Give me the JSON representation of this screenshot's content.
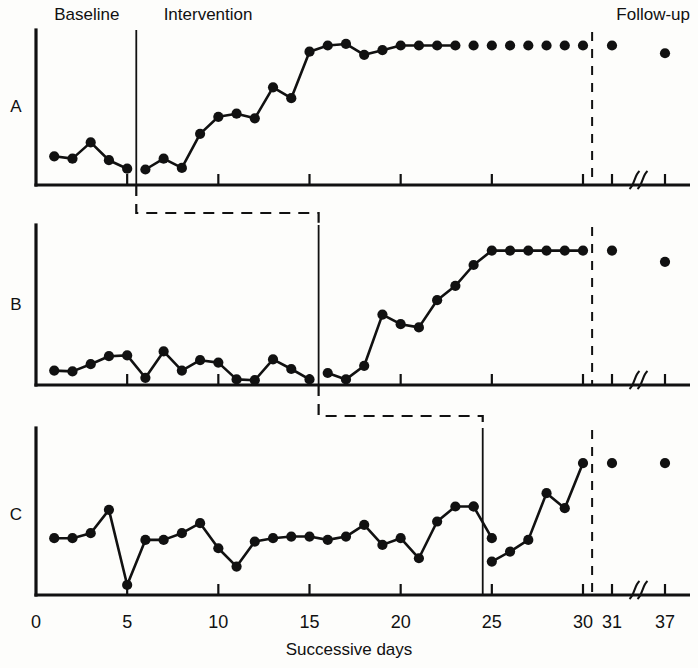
{
  "figure": {
    "background": "#fdfdfb",
    "ink": "#111111",
    "xlabel": "Successive days",
    "phase_labels": {
      "baseline": "Baseline",
      "intervention": "Intervention",
      "followup": "Follow-up"
    },
    "panel_labels": {
      "a": "A",
      "b": "B",
      "c": "C"
    },
    "axis_break_symbol": "∫∫"
  },
  "chart_data": {
    "type": "line",
    "title": "",
    "subtitle": "",
    "xlabel": "Successive days",
    "ylabel": "",
    "xlim": [
      0,
      38
    ],
    "ylim": [
      0,
      10
    ],
    "grid": false,
    "legend_position": "none",
    "xticks": [
      0,
      5,
      10,
      15,
      20,
      25,
      30,
      31,
      37
    ],
    "xtick_labels": [
      "0",
      "5",
      "10",
      "15",
      "20",
      "25",
      "30",
      "31",
      "37"
    ],
    "axis_break_between": [
      31,
      37
    ],
    "annotations": [
      {
        "text": "Baseline",
        "x": 2.5,
        "panel": "A",
        "position": "above-axis"
      },
      {
        "text": "Intervention",
        "x": 10.5,
        "panel": "A",
        "position": "above-axis"
      },
      {
        "text": "Follow-up",
        "x": 33.0,
        "panel": "A",
        "position": "above-axis"
      }
    ],
    "panels": [
      {
        "id": "A",
        "label": "A",
        "phase_change_day": 5.5,
        "followup_change_day": 30.5,
        "baseline_days": [
          1,
          2,
          3,
          4,
          5
        ],
        "segments": [
          {
            "name": "baseline",
            "connected": true,
            "x": [
              1,
              2,
              3,
              4,
              5
            ],
            "y": [
              1.85,
              1.7,
              2.75,
              1.6,
              1.05
            ]
          },
          {
            "name": "intervention",
            "connected": true,
            "x": [
              6,
              7,
              8,
              9,
              10,
              11,
              12,
              13,
              14,
              15,
              16,
              17,
              18,
              19,
              20,
              21,
              22,
              23
            ],
            "y": [
              1.0,
              1.7,
              1.1,
              3.3,
              4.4,
              4.6,
              4.3,
              6.3,
              5.6,
              8.6,
              9.0,
              9.1,
              8.4,
              8.7,
              9.0,
              9.0,
              9.0,
              9.0
            ]
          },
          {
            "name": "intervention-late-dots",
            "connected": false,
            "x": [
              24,
              25,
              26,
              27,
              28,
              29,
              30
            ],
            "y": [
              9.0,
              9.0,
              9.0,
              9.0,
              9.0,
              9.0,
              9.0
            ]
          },
          {
            "name": "follow-up",
            "connected": false,
            "x": [
              31,
              37
            ],
            "y": [
              9.0,
              8.5
            ]
          }
        ]
      },
      {
        "id": "B",
        "label": "B",
        "phase_change_day": 15.5,
        "followup_change_day": 30.5,
        "baseline_days": [
          1,
          2,
          3,
          4,
          5,
          6,
          7,
          8,
          9,
          10,
          11,
          12,
          13,
          14,
          15
        ],
        "segments": [
          {
            "name": "baseline",
            "connected": true,
            "x": [
              1,
              2,
              3,
              4,
              5,
              6,
              7,
              8,
              9,
              10,
              11,
              12,
              13,
              14,
              15
            ],
            "y": [
              0.9,
              0.85,
              1.3,
              1.8,
              1.85,
              0.45,
              2.1,
              0.9,
              1.55,
              1.4,
              0.35,
              0.3,
              1.6,
              1.0,
              0.35
            ]
          },
          {
            "name": "intervention",
            "connected": true,
            "x": [
              16,
              17,
              18,
              19,
              20,
              21,
              22,
              23,
              24,
              25,
              26,
              27,
              28,
              29,
              30
            ],
            "y": [
              0.75,
              0.35,
              1.2,
              4.4,
              3.8,
              3.6,
              5.3,
              6.2,
              7.5,
              8.4,
              8.4,
              8.4,
              8.4,
              8.4,
              8.4
            ]
          },
          {
            "name": "follow-up",
            "connected": false,
            "x": [
              31,
              37
            ],
            "y": [
              8.4,
              7.7
            ]
          }
        ]
      },
      {
        "id": "C",
        "label": "C",
        "phase_change_day": 24.5,
        "followup_change_day": 30.5,
        "baseline_days": [
          1,
          2,
          3,
          4,
          5,
          6,
          7,
          8,
          9,
          10,
          11,
          12,
          13,
          14,
          15,
          16,
          17,
          18,
          19,
          20,
          21,
          22,
          23,
          24
        ],
        "segments": [
          {
            "name": "baseline",
            "connected": true,
            "x": [
              1,
              2,
              3,
              4,
              5,
              6,
              7,
              8,
              9,
              10,
              11,
              12,
              13,
              14,
              15,
              16,
              17,
              18,
              19,
              20,
              21,
              22,
              23,
              24
            ],
            "y": [
              3.4,
              3.4,
              3.7,
              5.1,
              0.6,
              3.3,
              3.3,
              3.7,
              4.3,
              2.8,
              1.7,
              3.2,
              3.4,
              3.5,
              3.5,
              3.3,
              3.5,
              4.2,
              3.0,
              3.4,
              2.2,
              4.4,
              5.3,
              5.3
            ]
          },
          {
            "name": "baseline-continued",
            "connected": true,
            "x": [
              24,
              25
            ],
            "y": [
              5.3,
              3.4
            ]
          },
          {
            "name": "intervention",
            "connected": true,
            "x": [
              25,
              26,
              27,
              28,
              29,
              30
            ],
            "y": [
              2.0,
              2.6,
              3.3,
              6.1,
              5.2,
              7.9
            ]
          },
          {
            "name": "follow-up",
            "connected": false,
            "x": [
              31,
              37
            ],
            "y": [
              7.9,
              7.9
            ]
          }
        ]
      }
    ]
  }
}
